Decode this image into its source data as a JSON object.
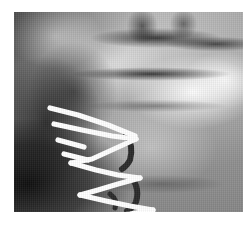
{
  "viewer": {
    "name": "radiograph-viewer",
    "background_color": "#ffffff"
  },
  "radiograph": {
    "modality_label": "X-ray",
    "view_label": "Cervical spine lateral fixation",
    "frame": {
      "x": 14,
      "y": 12,
      "width": 229,
      "height": 200
    },
    "tone": {
      "film_base": "#ababab",
      "bright_highlight": "#ffffff",
      "dark_shadow": "#111111",
      "hardware_color": "#ffffff",
      "rod_color": "#2b2b2b"
    },
    "regions": [
      {
        "name": "upper-vertebral-bodies",
        "tone": "mid-gray"
      },
      {
        "name": "dark-disc-band-upper",
        "tone": "dark"
      },
      {
        "name": "dark-disc-band-lower",
        "tone": "dark"
      },
      {
        "name": "left-mandible-shadow",
        "tone": "very-dark"
      },
      {
        "name": "right-bright-blob",
        "tone": "bright"
      },
      {
        "name": "upper-left-bright-band",
        "tone": "bright"
      }
    ],
    "hardware": {
      "label": "surgical-fixation-wires",
      "wire_color": "#ffffff",
      "wire_width": 5.0,
      "wires": [
        {
          "name": "wire-1-upper-long",
          "points": "36,96 62,102 92,112 120,123"
        },
        {
          "name": "wire-2-upper-diagonal",
          "points": "40,110 66,116 96,124 122,126"
        },
        {
          "name": "wire-3-apex-converge",
          "points": "122,126 100,136 78,146 58,150"
        },
        {
          "name": "wire-4-mid-v-left",
          "points": "58,150 82,158 104,164 126,166"
        },
        {
          "name": "wire-5-mid-v-right",
          "points": "126,166 104,172 84,178 66,182"
        },
        {
          "name": "wire-6-lower-long",
          "points": "66,182 92,188 116,194 138,198"
        },
        {
          "name": "wire-7-lower-tail",
          "points": "138,198 116,202 92,205 72,206"
        },
        {
          "name": "wire-8-short-stub",
          "points": "46,128 70,134"
        }
      ],
      "rods": [
        {
          "name": "rod-upper-curved",
          "color": "#2b2b2b",
          "points": "112,122 118,134 116,148 108,156"
        },
        {
          "name": "rod-lower-curved",
          "color": "#2b2b2b",
          "points": "118,168 124,178 122,190 114,198"
        }
      ]
    }
  }
}
